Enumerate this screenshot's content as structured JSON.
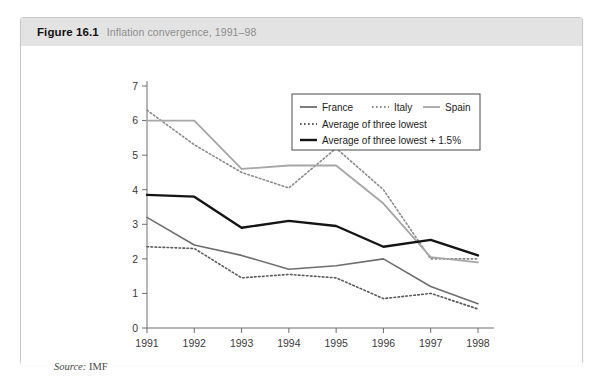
{
  "figure": {
    "number": "Figure 16.1",
    "caption": "Inflation convergence, 1991–98",
    "source_label": "Source:",
    "source_value": " IMF"
  },
  "colors": {
    "header_band": "#e3e3e3",
    "card_border": "#c9c9c9",
    "france": "#6e6e6e",
    "italy": "#8a8a8a",
    "spain": "#a6a6a6",
    "avg_lowest": "#5a5a5a",
    "avg_lowest_plus": "#141414",
    "axis": "#6f6f6f",
    "text": "#3a3a3a"
  },
  "chart_data": {
    "type": "line",
    "title": "Inflation convergence, 1991–98",
    "subtitle": "",
    "xlabel": "",
    "ylabel": "",
    "categories": [
      "1991",
      "1992",
      "1993",
      "1994",
      "1995",
      "1996",
      "1997",
      "1998"
    ],
    "x": [
      1991,
      1992,
      1993,
      1994,
      1995,
      1996,
      1997,
      1998
    ],
    "xlim": [
      1991,
      1998
    ],
    "ylim": [
      0,
      7
    ],
    "yticks": [
      0,
      1,
      2,
      3,
      4,
      5,
      6,
      7
    ],
    "grid": false,
    "legend_position": "top-right",
    "series": [
      {
        "name": "France",
        "style": "solid",
        "color": "#6e6e6e",
        "width": 1.6,
        "values": [
          3.2,
          2.4,
          2.1,
          1.7,
          1.8,
          2.0,
          1.2,
          0.7
        ]
      },
      {
        "name": "Italy",
        "style": "dotted",
        "color": "#8a8a8a",
        "width": 1.6,
        "values": [
          6.3,
          5.3,
          4.5,
          4.05,
          5.2,
          4.0,
          2.0,
          2.0
        ]
      },
      {
        "name": "Spain",
        "style": "solid",
        "color": "#a6a6a6",
        "width": 1.8,
        "values": [
          6.0,
          6.0,
          4.6,
          4.7,
          4.7,
          3.6,
          2.05,
          1.9
        ]
      },
      {
        "name": "Average of three lowest",
        "style": "dotted",
        "color": "#5a5a5a",
        "width": 1.6,
        "values": [
          2.35,
          2.3,
          1.45,
          1.55,
          1.45,
          0.85,
          1.0,
          0.55
        ]
      },
      {
        "name": "Average of three lowest + 1.5%",
        "style": "solid",
        "color": "#141414",
        "width": 2.4,
        "values": [
          3.85,
          3.8,
          2.9,
          3.1,
          2.95,
          2.35,
          2.55,
          2.1
        ]
      }
    ],
    "legend": [
      {
        "name": "France",
        "style": "solid",
        "color": "#6e6e6e",
        "row": 0,
        "col": 0
      },
      {
        "name": "Italy",
        "style": "dotted",
        "color": "#8a8a8a",
        "row": 0,
        "col": 1
      },
      {
        "name": "Spain",
        "style": "solid",
        "color": "#a6a6a6",
        "row": 0,
        "col": 2
      },
      {
        "name": "Average of three lowest",
        "style": "dotted",
        "color": "#5a5a5a",
        "row": 1,
        "col": 0
      },
      {
        "name": "Average of three lowest + 1.5%",
        "style": "solid",
        "color": "#141414",
        "row": 2,
        "col": 0
      }
    ]
  }
}
